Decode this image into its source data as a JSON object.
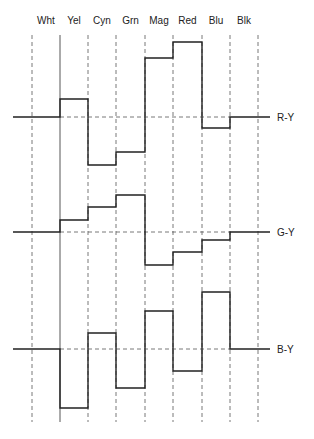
{
  "diagram": {
    "title": "",
    "bars": [
      "Wht",
      "Yel",
      "Cyn",
      "Grn",
      "Mag",
      "Red",
      "Blu",
      "Blk"
    ],
    "boundaries_x": [
      32,
      60,
      88,
      116,
      145,
      173,
      202,
      230,
      258
    ],
    "line_start_x": 13,
    "line_end_x": 270,
    "grid_top_y": 35,
    "grid_bottom_y": 422,
    "solid_boundary_index": 1,
    "stroke_color": "#222222",
    "dash_color": "#555555",
    "signals": [
      {
        "name": "R-Y",
        "baseline_y": 117,
        "levels_y": [
          117,
          99,
          165,
          152,
          58,
          42,
          128,
          117
        ]
      },
      {
        "name": "G-Y",
        "baseline_y": 232,
        "levels_y": [
          232,
          220,
          207,
          195,
          265,
          252,
          240,
          232
        ]
      },
      {
        "name": "B-Y",
        "baseline_y": 349,
        "levels_y": [
          349,
          408,
          333,
          388,
          311,
          371,
          292,
          349
        ]
      }
    ]
  },
  "labels": {
    "bar_0": "Wht",
    "bar_1": "Yel",
    "bar_2": "Cyn",
    "bar_3": "Grn",
    "bar_4": "Mag",
    "bar_5": "Red",
    "bar_6": "Blu",
    "bar_7": "Blk",
    "sig_0": "R-Y",
    "sig_1": "G-Y",
    "sig_2": "B-Y"
  }
}
